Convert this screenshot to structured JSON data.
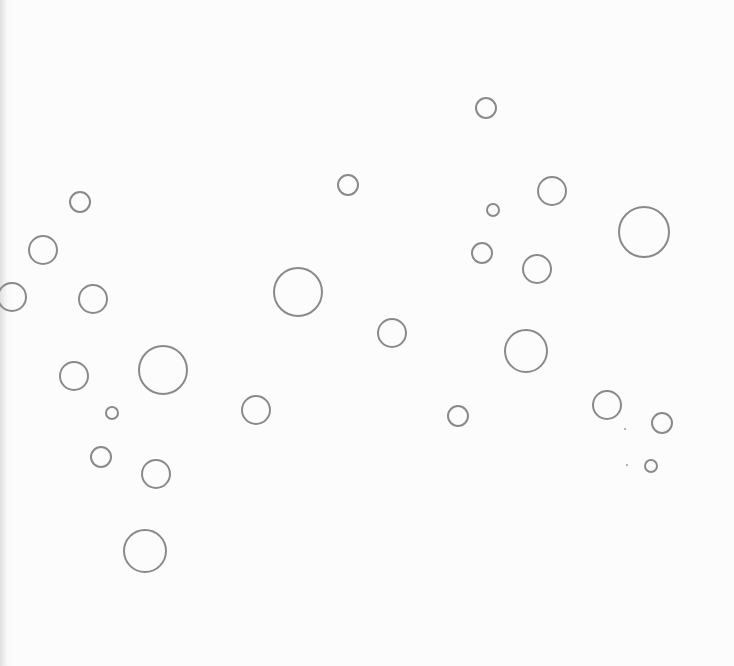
{
  "page": {
    "background_color": "#fcfcfc",
    "stroke_color": "#8a8a8a",
    "width": 734,
    "height": 666
  },
  "bubbles": [
    {
      "cx": 486,
      "cy": 108,
      "r": 11
    },
    {
      "cx": 348,
      "cy": 185,
      "r": 11
    },
    {
      "cx": 552,
      "cy": 191,
      "r": 15
    },
    {
      "cx": 80,
      "cy": 202,
      "r": 11
    },
    {
      "cx": 493,
      "cy": 210,
      "r": 7
    },
    {
      "cx": 644,
      "cy": 232,
      "r": 26
    },
    {
      "cx": 43,
      "cy": 250,
      "r": 15
    },
    {
      "cx": 482,
      "cy": 253,
      "r": 11
    },
    {
      "cx": 537,
      "cy": 269,
      "r": 15
    },
    {
      "cx": 298,
      "cy": 292,
      "r": 25
    },
    {
      "cx": 12,
      "cy": 297,
      "r": 15
    },
    {
      "cx": 93,
      "cy": 299,
      "r": 15
    },
    {
      "cx": 392,
      "cy": 333,
      "r": 15
    },
    {
      "cx": 526,
      "cy": 351,
      "r": 22
    },
    {
      "cx": 163,
      "cy": 370,
      "r": 25
    },
    {
      "cx": 74,
      "cy": 376,
      "r": 15
    },
    {
      "cx": 607,
      "cy": 405,
      "r": 15
    },
    {
      "cx": 256,
      "cy": 410,
      "r": 15
    },
    {
      "cx": 112,
      "cy": 413,
      "r": 7
    },
    {
      "cx": 458,
      "cy": 416,
      "r": 11
    },
    {
      "cx": 662,
      "cy": 423,
      "r": 11
    },
    {
      "cx": 101,
      "cy": 457,
      "r": 11
    },
    {
      "cx": 651,
      "cy": 466,
      "r": 7
    },
    {
      "cx": 156,
      "cy": 474,
      "r": 15
    },
    {
      "cx": 145,
      "cy": 551,
      "r": 22
    }
  ],
  "specks": [
    {
      "x": 624,
      "y": 428
    },
    {
      "x": 626,
      "y": 464
    }
  ]
}
